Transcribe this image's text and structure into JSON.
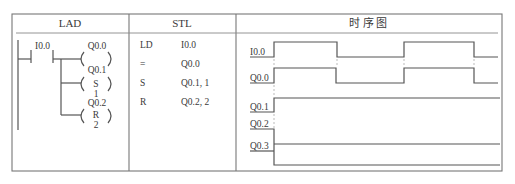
{
  "table": {
    "headers": {
      "lad": "LAD",
      "stl": "STL",
      "timing": "时 序 图"
    }
  },
  "lad": {
    "contact_label": "I0.0",
    "coils": [
      {
        "address": "Q0.0",
        "type": "",
        "count": ""
      },
      {
        "address": "Q0.1",
        "type": "S",
        "count": "1"
      },
      {
        "address": "Q0.2",
        "type": "R",
        "count": "2"
      }
    ]
  },
  "stl": {
    "rows": [
      {
        "op": "LD",
        "operand": "I0.0"
      },
      {
        "op": "=",
        "operand": "Q0.0"
      },
      {
        "op": "S",
        "operand": "Q0.1, 1"
      },
      {
        "op": "R",
        "operand": "Q0.2, 2"
      }
    ]
  },
  "timing": {
    "signals": [
      {
        "name": "I0.0"
      },
      {
        "name": "Q0.0"
      },
      {
        "name": "Q0.1"
      },
      {
        "name": "Q0.2"
      },
      {
        "name": "Q0.3"
      }
    ]
  },
  "colors": {
    "line": "#555555",
    "border": "#777777",
    "text": "#3a3a3a"
  }
}
